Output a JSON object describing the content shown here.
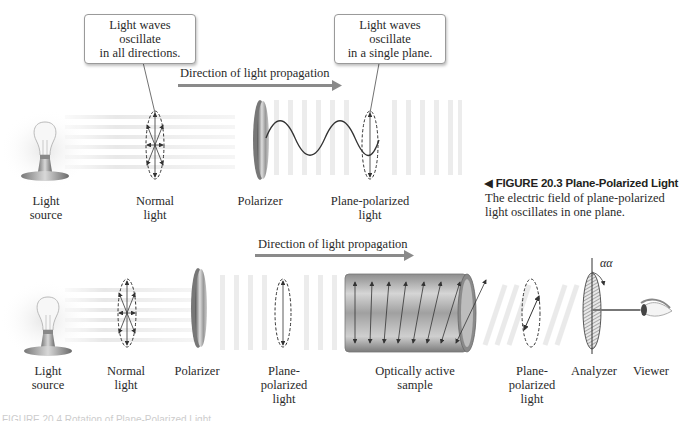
{
  "figure_top": {
    "callouts": [
      {
        "text": "Light waves oscillate\nin all directions."
      },
      {
        "text": "Light waves oscillate\nin a single plane."
      }
    ],
    "direction_label": "Direction of light propagation",
    "labels": {
      "light_source": "Light\nsource",
      "normal_light": "Normal\nlight",
      "polarizer": "Polarizer",
      "plane_polarized_light": "Plane-polarized\nlight"
    },
    "caption": {
      "marker": "◀",
      "title": "FIGURE 20.3  Plane-Polarized Light",
      "body": "The electric field of plane-polarized\nlight oscillates in one plane."
    }
  },
  "figure_bottom": {
    "direction_label": "Direction of light propagation",
    "labels": {
      "light_source": "Light\nsource",
      "normal_light": "Normal\nlight",
      "polarizer": "Polarizer",
      "plane_polarized_light_1": "Plane-\npolarized\nlight",
      "optically_active_sample": "Optically active\nsample",
      "plane_polarized_light_2": "Plane-\npolarized\nlight",
      "analyzer": "Analyzer",
      "viewer": "Viewer"
    },
    "angle_label": "αα",
    "clipped_caption": "FIGURE 20.4  Rotation of Plane-Polarized Light"
  },
  "colors": {
    "arrow": "#8a8a8a",
    "text": "#2a2a2a",
    "outline": "#333333"
  }
}
